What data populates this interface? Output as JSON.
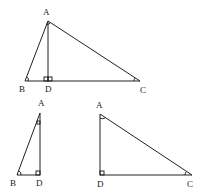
{
  "figure": {
    "top_triangle": {
      "labels": {
        "A": "A",
        "B": "B",
        "C": "C",
        "D": "D"
      }
    },
    "bottom_left_triangle": {
      "labels": {
        "A": "A",
        "B": "B",
        "D": "D"
      }
    },
    "bottom_right_triangle": {
      "labels": {
        "A": "A",
        "D": "D",
        "C": "C"
      }
    }
  }
}
